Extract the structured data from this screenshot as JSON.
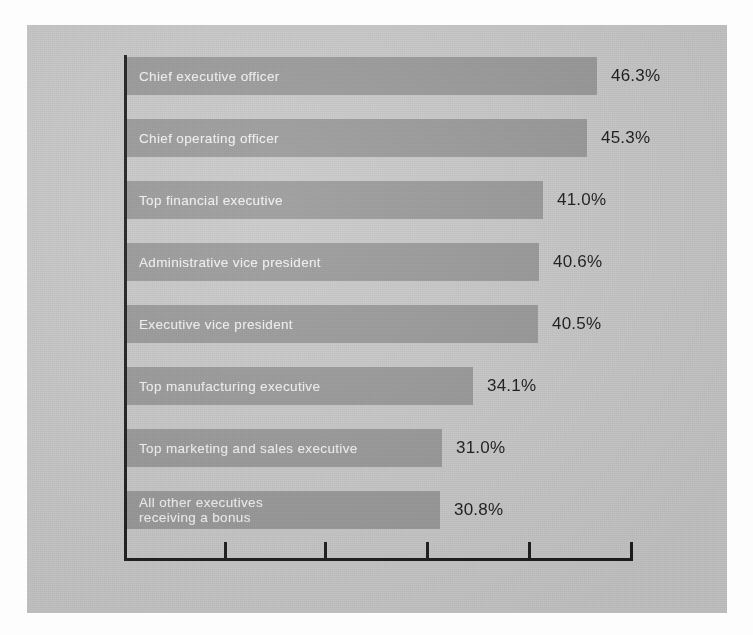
{
  "figure": {
    "background_color": "#fdfdfd",
    "panel_color": "#c9c9c9",
    "bar_color": "#9a9a9a",
    "bar_label_color": "#f2f2f2",
    "value_color": "#1a1a1a",
    "axis_color": "#1c1c1c"
  },
  "chart_data": {
    "type": "bar",
    "orientation": "horizontal",
    "title": "",
    "subtitle": "",
    "xlabel": "",
    "ylabel": "",
    "xlim": [
      0,
      50
    ],
    "grid": false,
    "legend": null,
    "axis_ticks": [
      "",
      "",
      "",
      "",
      "",
      ""
    ],
    "value_suffix": "%",
    "categories": [
      "Chief executive officer",
      "Chief operating officer",
      "Top financial executive",
      "Administrative vice president",
      "Executive vice president",
      "Top manufacturing executive",
      "Top marketing and sales executive",
      "All other executives\nreceiving a bonus"
    ],
    "values": [
      46.3,
      45.3,
      41.0,
      40.6,
      40.5,
      34.1,
      31.0,
      30.8
    ],
    "value_labels": [
      "46.3%",
      "45.3%",
      "41.0%",
      "40.6%",
      "40.5%",
      "34.1%",
      "31.0%",
      "30.8%"
    ]
  }
}
